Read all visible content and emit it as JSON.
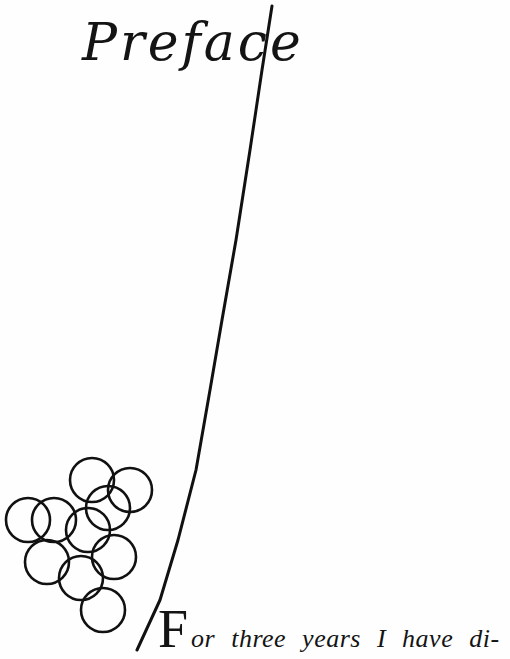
{
  "page": {
    "heading": "Preface",
    "opening_line": {
      "drop_cap": "F",
      "text": "or three years I have di-"
    }
  },
  "decoration": {
    "diagonal_rule": {
      "from": [
        272,
        6
      ],
      "to": [
        137,
        650
      ],
      "color": "#111111"
    },
    "circles": {
      "count": 10,
      "radius": 22,
      "stroke_color": "#111111",
      "centers": [
        [
          92,
          480
        ],
        [
          130,
          490
        ],
        [
          108,
          508
        ],
        [
          28,
          520
        ],
        [
          54,
          520
        ],
        [
          88,
          530
        ],
        [
          47,
          562
        ],
        [
          114,
          557
        ],
        [
          81,
          578
        ],
        [
          103,
          610
        ]
      ]
    }
  }
}
